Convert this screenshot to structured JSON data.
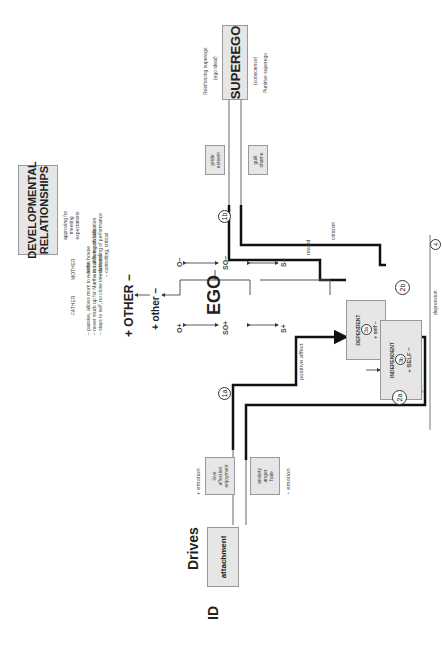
{
  "id": {
    "label": "ID",
    "drives_title": "Drives",
    "drive_box": "attachment"
  },
  "emotions": {
    "positive": {
      "sign": "+",
      "label": "emotion",
      "items": "love\naffection\nenjoyment"
    },
    "negative": {
      "sign": "−",
      "label": "emotion",
      "items": "anxiety\nanger\nhate"
    }
  },
  "affect": {
    "positive": "positive affect",
    "negative": "negative affect"
  },
  "markers": {
    "m1a": "1a",
    "m1b": "1b",
    "m2a": "2a",
    "m2b": "2b",
    "m3a": "3a",
    "m3b": "3b",
    "m4": "4"
  },
  "ego": {
    "title": "EGO",
    "nodes": {
      "o_plus": "O+",
      "o_minus": "O−",
      "so_plus": "SO+",
      "so_minus": "SO−",
      "s_plus": "S+",
      "s_minus": "S−"
    },
    "other_small": "+ other −",
    "other_big": "+ OTHER −"
  },
  "self": {
    "dependent": {
      "title": "DEPENDENT",
      "sub": "+ self −"
    },
    "independent": {
      "title": "INDEPENDENT",
      "sub": "+ SELF −"
    },
    "depression": "depression"
  },
  "superego": {
    "title": "SUPEREGO",
    "reinforcing": "Reinforcing superego",
    "ego_ideal": "(ego ideal)",
    "conscience": "(conscience)",
    "punitive": "Punitive superego",
    "pride": "pride\nesteem",
    "guilt": "guilt\nshame",
    "reward": "reward",
    "criticism": "criticism"
  },
  "developmental": {
    "title_line1": "DEVELOPMENTAL",
    "title_line2": "RELATIONSHIPS",
    "approving": "approving for\nmeeting\nexpectations",
    "mother": "MOTHER",
    "father": "FATHER",
    "mother_traits": [
      "– strict",
      "– not allowing socialization",
      "– demanding of performance",
      "– controlling, critical"
    ],
    "father_traits": [
      "– passive, allows mom to rule the house",
      "– never stuck up for Martha in conflicts with kids",
      "– stays to self, no close interactions"
    ]
  }
}
